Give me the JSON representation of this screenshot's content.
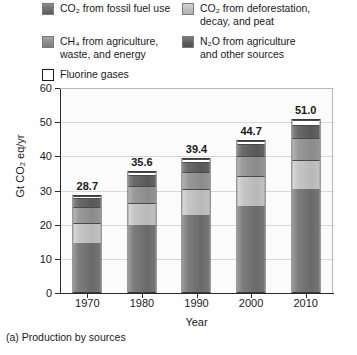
{
  "legend": {
    "items": [
      {
        "id": "co2-fossil",
        "label": "CO₂ from fossil fuel use",
        "color": "#6d6d6d",
        "swatch": "sw-fossil"
      },
      {
        "id": "co2-defor",
        "label": "CO₂ from deforestation,\ndecay, and peat",
        "color": "#bdbdbd",
        "swatch": "sw-defor"
      },
      {
        "id": "ch4-agri",
        "label": "CH₄ from agriculture,\nwaste, and energy",
        "color": "#8b8b8b",
        "swatch": "sw-ch4"
      },
      {
        "id": "n2o-agri",
        "label": "N₂O from agriculture\nand other sources",
        "color": "#5e5e5e",
        "swatch": "sw-n2o"
      },
      {
        "id": "fluorine",
        "label": "Fluorine gases",
        "color": "#ffffff",
        "swatch": "sw-fluor"
      }
    ]
  },
  "chart_data": {
    "type": "bar",
    "subtype": "stacked-bar",
    "title": "",
    "caption": "(a) Production by sources",
    "xlabel": "Year",
    "ylabel": "Gt CO₂ eq/yr",
    "categories": [
      "1970",
      "1980",
      "1990",
      "2000",
      "2010"
    ],
    "ylim": [
      0,
      60
    ],
    "yticks": [
      0,
      10,
      20,
      30,
      40,
      50,
      60
    ],
    "ytick_labels": [
      "0",
      "10",
      "20",
      "30",
      "40",
      "50",
      "60"
    ],
    "grid": true,
    "legend_position": "above-plot",
    "series": [
      {
        "name": "CO₂ from fossil fuel use",
        "values": [
          14.5,
          20.0,
          23.0,
          25.5,
          30.5
        ]
      },
      {
        "name": "CO₂ from deforestation, decay, and peat",
        "values": [
          6.2,
          6.5,
          7.6,
          8.9,
          8.5
        ]
      },
      {
        "name": "CH₄ from agriculture, waste, and energy",
        "values": [
          4.6,
          5.2,
          5.0,
          6.0,
          6.5
        ]
      },
      {
        "name": "N₂O from agriculture and other sources",
        "values": [
          2.8,
          3.2,
          3.1,
          3.6,
          4.0
        ]
      },
      {
        "name": "Fluorine gases",
        "values": [
          0.6,
          0.7,
          0.7,
          0.7,
          1.5
        ]
      }
    ],
    "totals": [
      28.7,
      35.6,
      39.4,
      44.7,
      51.0
    ],
    "total_labels": [
      "28.7",
      "35.6",
      "39.4",
      "44.7",
      "51.0"
    ]
  }
}
